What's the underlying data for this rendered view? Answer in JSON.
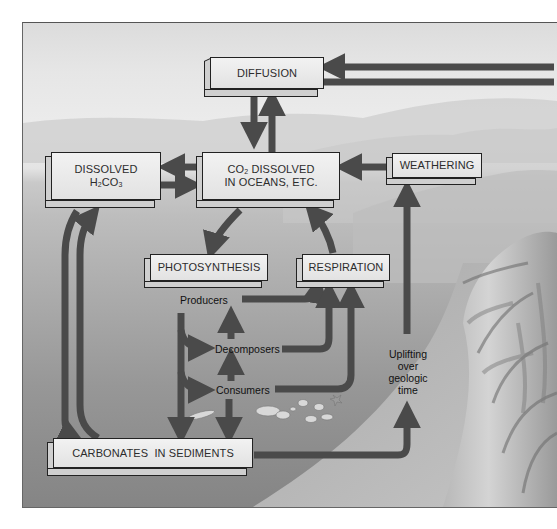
{
  "diagram": {
    "boxes": {
      "diffusion": "DIFFUSION",
      "dissolved_h2co3_line1": "DISSOLVED",
      "dissolved_h2co3_line2_prefix": "H",
      "dissolved_h2co3_line2_sub1": "2",
      "dissolved_h2co3_line2_mid": "CO",
      "dissolved_h2co3_line2_sub2": "3",
      "co2_line1_prefix": "CO",
      "co2_line1_sub": "2",
      "co2_line1_suffix": " DISSOLVED",
      "co2_line2": "IN OCEANS, ETC.",
      "weathering": "WEATHERING",
      "photosynthesis": "PHOTOSYNTHESIS",
      "respiration": "RESPIRATION",
      "carbonates": "CARBONATES  IN SEDIMENTS"
    },
    "labels": {
      "producers": "Producers",
      "decomposers": "Decomposers",
      "consumers": "Consumers",
      "uplifting_1": "Uplifting",
      "uplifting_2": "over",
      "uplifting_3": "geologic",
      "uplifting_4": "time"
    },
    "connections": [
      {
        "from": "atmosphere",
        "to": "DIFFUSION"
      },
      {
        "from": "DIFFUSION",
        "to": "atmosphere"
      },
      {
        "from": "DIFFUSION",
        "to": "CO2 DISSOLVED IN OCEANS, ETC."
      },
      {
        "from": "CO2 DISSOLVED IN OCEANS, ETC.",
        "to": "DIFFUSION"
      },
      {
        "from": "CO2 DISSOLVED IN OCEANS, ETC.",
        "to": "DISSOLVED H2CO3"
      },
      {
        "from": "DISSOLVED H2CO3",
        "to": "CO2 DISSOLVED IN OCEANS, ETC."
      },
      {
        "from": "WEATHERING",
        "to": "CO2 DISSOLVED IN OCEANS, ETC."
      },
      {
        "from": "CO2 DISSOLVED IN OCEANS, ETC.",
        "to": "PHOTOSYNTHESIS"
      },
      {
        "from": "RESPIRATION",
        "to": "CO2 DISSOLVED IN OCEANS, ETC."
      },
      {
        "from": "Producers",
        "to": "RESPIRATION"
      },
      {
        "from": "Decomposers",
        "to": "RESPIRATION"
      },
      {
        "from": "Consumers",
        "to": "RESPIRATION"
      },
      {
        "from": "Decomposers",
        "to": "Producers"
      },
      {
        "from": "Consumers",
        "to": "Decomposers"
      },
      {
        "from": "Producers",
        "to": "Decomposers"
      },
      {
        "from": "Producers",
        "to": "Consumers"
      },
      {
        "from": "Producers",
        "to": "CARBONATES IN SEDIMENTS"
      },
      {
        "from": "Consumers",
        "to": "CARBONATES IN SEDIMENTS"
      },
      {
        "from": "DISSOLVED H2CO3",
        "to": "CARBONATES IN SEDIMENTS"
      },
      {
        "from": "CARBONATES IN SEDIMENTS",
        "to": "DISSOLVED H2CO3"
      },
      {
        "from": "CARBONATES IN SEDIMENTS",
        "to": "WEATHERING",
        "via": "Uplifting over geologic time"
      }
    ],
    "colors": {
      "arrow": "#4a4a4a",
      "box_face": "#ececec",
      "box_side": "#cfcfcf",
      "box_border": "#222222",
      "sky": "#e6e6e6",
      "sea": "#a5a5a5"
    }
  }
}
